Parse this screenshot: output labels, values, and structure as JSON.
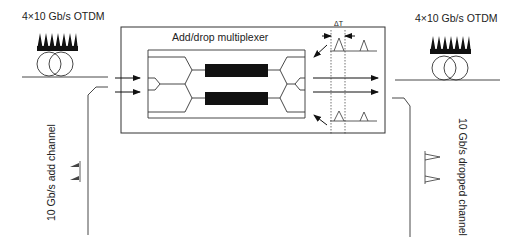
{
  "diagram": {
    "title": "Add/drop multiplexer",
    "input": {
      "label": "4×10 Gb/s OTDM"
    },
    "output": {
      "label": "4×10 Gb/s OTDM"
    },
    "add_channel": {
      "label": "10 Gb/s add channel"
    },
    "dropped_channel": {
      "label": "10 Gb/s dropped channel"
    },
    "timing": {
      "label": "ΔT"
    },
    "components": [
      "input fiber spool",
      "Mach-Zehnder interferometer waveguide circuit",
      "two nonlinear phase-shift elements (black bars)",
      "output fiber spool",
      "add port",
      "drop port"
    ],
    "colors": {
      "line": "#333333",
      "fill": "#111111",
      "background": "#ffffff"
    }
  }
}
